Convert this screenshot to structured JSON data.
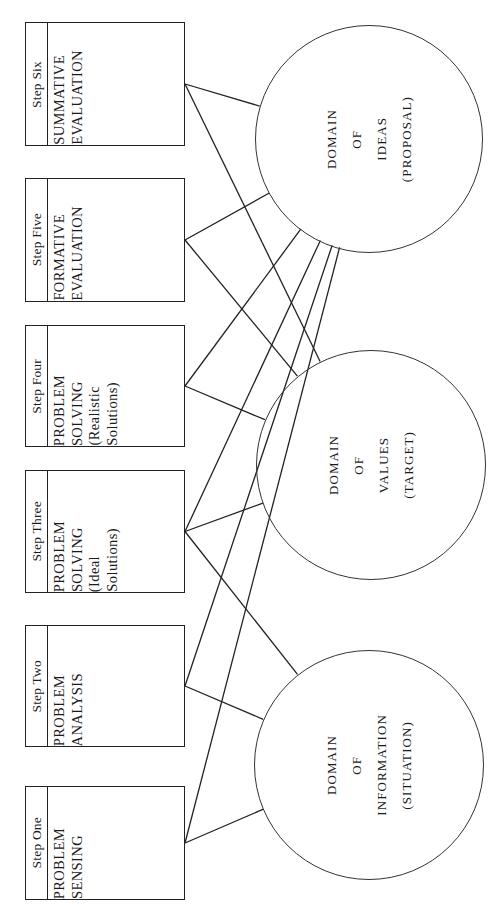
{
  "diagram": {
    "orientation": "rotated-90",
    "steps": [
      {
        "id": "step-six",
        "head": "Step Six",
        "lines": [
          "SUMMATIVE",
          "EVALUATION"
        ]
      },
      {
        "id": "step-five",
        "head": "Step Five",
        "lines": [
          "FORMATIVE",
          "EVALUATION"
        ]
      },
      {
        "id": "step-four",
        "head": "Step Four",
        "lines": [
          "PROBLEM",
          "SOLVING",
          "(Realistic",
          "Solutions)"
        ]
      },
      {
        "id": "step-three",
        "head": "Step Three",
        "lines": [
          "PROBLEM",
          "SOLVING",
          "(Ideal",
          "Solutions)"
        ]
      },
      {
        "id": "step-two",
        "head": "Step Two",
        "lines": [
          "PROBLEM",
          "ANALYSIS"
        ]
      },
      {
        "id": "step-one",
        "head": "Step One",
        "lines": [
          "PROBLEM",
          "SENSING"
        ]
      }
    ],
    "domains": [
      {
        "id": "domain-ideas",
        "lines": [
          "DOMAIN",
          "OF",
          "IDEAS",
          "(PROPOSAL)"
        ]
      },
      {
        "id": "domain-values",
        "lines": [
          "DOMAIN",
          "OF",
          "VALUES",
          "(TARGET)"
        ]
      },
      {
        "id": "domain-information",
        "lines": [
          "DOMAIN",
          "OF",
          "INFORMATION",
          "(SITUATION)"
        ]
      }
    ],
    "colors": {
      "stroke": "#222222",
      "circle_stroke": "#333333",
      "text": "#1a1a1a",
      "background": "#ffffff"
    },
    "connections": [
      {
        "from": "step-six",
        "to": "domain-ideas"
      },
      {
        "from": "step-six",
        "to": "domain-values"
      },
      {
        "from": "step-five",
        "to": "domain-ideas"
      },
      {
        "from": "step-five",
        "to": "domain-values"
      },
      {
        "from": "step-four",
        "to": "domain-ideas"
      },
      {
        "from": "step-four",
        "to": "domain-values"
      },
      {
        "from": "step-three",
        "to": "domain-ideas"
      },
      {
        "from": "step-three",
        "to": "domain-values"
      },
      {
        "from": "step-three",
        "to": "domain-information"
      },
      {
        "from": "step-two",
        "to": "domain-ideas"
      },
      {
        "from": "step-two",
        "to": "domain-information"
      },
      {
        "from": "step-one",
        "to": "domain-ideas"
      },
      {
        "from": "step-one",
        "to": "domain-information"
      }
    ]
  },
  "geometry": {
    "boxes": [
      {
        "id": "step-six",
        "x": 25,
        "y": 22,
        "w": 160,
        "h": 124
      },
      {
        "id": "step-five",
        "x": 25,
        "y": 178,
        "w": 160,
        "h": 124
      },
      {
        "id": "step-four",
        "x": 25,
        "y": 325,
        "w": 160,
        "h": 122
      },
      {
        "id": "step-three",
        "x": 25,
        "y": 470,
        "w": 160,
        "h": 123
      },
      {
        "id": "step-two",
        "x": 25,
        "y": 625,
        "w": 160,
        "h": 122
      },
      {
        "id": "step-one",
        "x": 25,
        "y": 786,
        "w": 160,
        "h": 114
      }
    ],
    "circles": [
      {
        "id": "domain-ideas",
        "cx": 368,
        "cy": 138,
        "r": 113
      },
      {
        "id": "domain-values",
        "cx": 370,
        "cy": 464,
        "r": 114
      },
      {
        "id": "domain-information",
        "cx": 368,
        "cy": 764,
        "r": 114
      }
    ]
  }
}
